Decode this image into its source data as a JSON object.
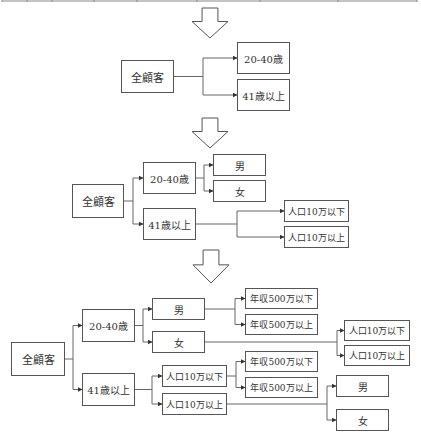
{
  "colors": {
    "line": "#666666",
    "box_border": "#555555",
    "text": "#333333",
    "arrow_fill": "#ffffff"
  },
  "top_table": {
    "y": 1,
    "x_start": 2,
    "x_end": 417,
    "dividers": [
      2,
      27,
      52,
      94,
      137,
      197,
      260,
      338,
      417
    ]
  },
  "transition_arrows": [
    {
      "id": "arrow-1",
      "x": 192,
      "y": 8,
      "w": 36,
      "h": 30
    },
    {
      "id": "arrow-2",
      "x": 192,
      "y": 118,
      "w": 36,
      "h": 30
    },
    {
      "id": "arrow-3",
      "x": 193,
      "y": 250,
      "w": 36,
      "h": 33
    }
  ],
  "diagrams": [
    {
      "id": "step-1",
      "nodes": [
        {
          "id": "d1-all",
          "label": "全顧客",
          "x": 121,
          "y": 60,
          "w": 53,
          "h": 33,
          "fs": 11
        },
        {
          "id": "d1-age-20-40",
          "label": "20-40歳",
          "x": 237,
          "y": 42,
          "w": 53,
          "h": 32,
          "fs": 10
        },
        {
          "id": "d1-age-41plus",
          "label": "41歳以上",
          "x": 237,
          "y": 79,
          "w": 53,
          "h": 32,
          "fs": 10
        }
      ],
      "edges": [
        {
          "from": "d1-all",
          "to": [
            "d1-age-20-40",
            "d1-age-41plus"
          ],
          "split_x": 203
        }
      ]
    },
    {
      "id": "step-2",
      "nodes": [
        {
          "id": "d2-all",
          "label": "全顧客",
          "x": 72,
          "y": 184,
          "w": 52,
          "h": 34,
          "fs": 11
        },
        {
          "id": "d2-age-20-40",
          "label": "20-40歳",
          "x": 143,
          "y": 162,
          "w": 53,
          "h": 32,
          "fs": 10
        },
        {
          "id": "d2-age-41plus",
          "label": "41歳以上",
          "x": 143,
          "y": 208,
          "w": 53,
          "h": 32,
          "fs": 10
        },
        {
          "id": "d2-male",
          "label": "男",
          "x": 213,
          "y": 154,
          "w": 53,
          "h": 22,
          "fs": 10
        },
        {
          "id": "d2-female",
          "label": "女",
          "x": 213,
          "y": 180,
          "w": 53,
          "h": 22,
          "fs": 10
        },
        {
          "id": "d2-pop-under",
          "label": "人口10万以下",
          "x": 284,
          "y": 200,
          "w": 65,
          "h": 22,
          "fs": 9
        },
        {
          "id": "d2-pop-over",
          "label": "人口10万以上",
          "x": 284,
          "y": 226,
          "w": 65,
          "h": 22,
          "fs": 9
        }
      ],
      "edges": [
        {
          "from": "d2-all",
          "to": [
            "d2-age-20-40",
            "d2-age-41plus"
          ],
          "split_x": 133
        },
        {
          "from": "d2-age-20-40",
          "to": [
            "d2-male",
            "d2-female"
          ],
          "split_x": 204
        },
        {
          "from": "d2-age-41plus",
          "to": [
            "d2-pop-under",
            "d2-pop-over"
          ],
          "split_x": 237
        }
      ]
    },
    {
      "id": "step-3",
      "nodes": [
        {
          "id": "d3-all",
          "label": "全顧客",
          "x": 11,
          "y": 342,
          "w": 54,
          "h": 34,
          "fs": 11
        },
        {
          "id": "d3-age-20-40",
          "label": "20-40歳",
          "x": 82,
          "y": 309,
          "w": 53,
          "h": 33,
          "fs": 10
        },
        {
          "id": "d3-age-41plus",
          "label": "41歳以上",
          "x": 82,
          "y": 373,
          "w": 53,
          "h": 33,
          "fs": 10
        },
        {
          "id": "d3-male",
          "label": "男",
          "x": 152,
          "y": 298,
          "w": 53,
          "h": 22,
          "fs": 10
        },
        {
          "id": "d3-female",
          "label": "女",
          "x": 152,
          "y": 331,
          "w": 53,
          "h": 22,
          "fs": 10
        },
        {
          "id": "d3-pop-under",
          "label": "人口10万以下",
          "x": 162,
          "y": 365,
          "w": 65,
          "h": 22,
          "fs": 9
        },
        {
          "id": "d3-pop-over",
          "label": "人口10万以上",
          "x": 162,
          "y": 393,
          "w": 65,
          "h": 22,
          "fs": 9
        },
        {
          "id": "d3-male-income-under",
          "label": "年収500万以下",
          "x": 245,
          "y": 288,
          "w": 73,
          "h": 21,
          "fs": 9
        },
        {
          "id": "d3-male-income-over",
          "label": "年収500万以上",
          "x": 245,
          "y": 314,
          "w": 73,
          "h": 21,
          "fs": 9
        },
        {
          "id": "d3-female-pop-under",
          "label": "人口10万以下",
          "x": 344,
          "y": 320,
          "w": 66,
          "h": 21,
          "fs": 9
        },
        {
          "id": "d3-female-pop-over",
          "label": "人口10万以上",
          "x": 344,
          "y": 345,
          "w": 66,
          "h": 21,
          "fs": 9
        },
        {
          "id": "d3-pop-under-income-under",
          "label": "年収500万以下",
          "x": 245,
          "y": 351,
          "w": 73,
          "h": 21,
          "fs": 9
        },
        {
          "id": "d3-pop-under-income-over",
          "label": "年収500万以上",
          "x": 245,
          "y": 377,
          "w": 73,
          "h": 21,
          "fs": 9
        },
        {
          "id": "d3-pop-over-male",
          "label": "男",
          "x": 336,
          "y": 375,
          "w": 53,
          "h": 22,
          "fs": 10
        },
        {
          "id": "d3-pop-over-female",
          "label": "女",
          "x": 336,
          "y": 409,
          "w": 53,
          "h": 22,
          "fs": 10
        }
      ],
      "edges": [
        {
          "from": "d3-all",
          "to": [
            "d3-age-20-40",
            "d3-age-41plus"
          ],
          "split_x": 73
        },
        {
          "from": "d3-age-20-40",
          "to": [
            "d3-male",
            "d3-female"
          ],
          "split_x": 143
        },
        {
          "from": "d3-age-41plus",
          "to": [
            "d3-pop-under",
            "d3-pop-over"
          ],
          "split_x": 152
        },
        {
          "from": "d3-male",
          "to": [
            "d3-male-income-under",
            "d3-male-income-over"
          ],
          "split_x": 235
        },
        {
          "from": "d3-female",
          "to": [
            "d3-female-pop-under",
            "d3-female-pop-over"
          ],
          "split_x": 337
        },
        {
          "from": "d3-pop-under",
          "to": [
            "d3-pop-under-income-under",
            "d3-pop-under-income-over"
          ],
          "split_x": 236
        },
        {
          "from": "d3-pop-over",
          "to": [
            "d3-pop-over-male",
            "d3-pop-over-female"
          ],
          "split_x": 327
        }
      ]
    }
  ]
}
